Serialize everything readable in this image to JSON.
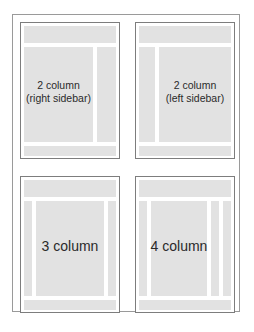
{
  "diagram": {
    "title": "",
    "layouts": [
      {
        "id": "two-col-right",
        "label_line1": "2 column",
        "label_line2": "(right sidebar)",
        "columns": 2,
        "sidebar": "right"
      },
      {
        "id": "two-col-left",
        "label_line1": "2 column",
        "label_line2": "(left sidebar)",
        "columns": 2,
        "sidebar": "left"
      },
      {
        "id": "three-col",
        "label_line1": "3 column",
        "columns": 3
      },
      {
        "id": "four-col",
        "label_line1": "4 column",
        "columns": 4
      }
    ],
    "colors": {
      "block_fill": "#e2e2e2",
      "panel_border": "#7d7d7d",
      "frame_border": "#9a9a9a",
      "text": "#2a2a2a"
    }
  }
}
